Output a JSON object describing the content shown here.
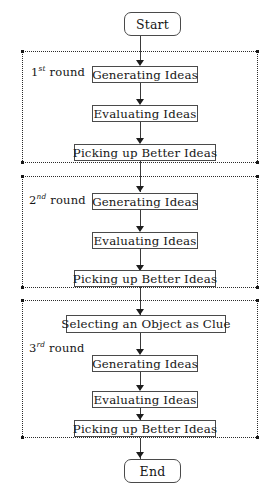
{
  "diagram": {
    "start_label": "Start",
    "end_label": "End",
    "clue_step_label": "Selecting an Object as Clue",
    "rounds": [
      {
        "ordinal": "1",
        "suffix": "st",
        "word": "round",
        "steps": [
          "Generating Ideas",
          "Evaluating Ideas",
          "Picking up Better Ideas"
        ]
      },
      {
        "ordinal": "2",
        "suffix": "nd",
        "word": "round",
        "steps": [
          "Generating Ideas",
          "Evaluating Ideas",
          "Picking up Better Ideas"
        ]
      },
      {
        "ordinal": "3",
        "suffix": "rd",
        "word": "round",
        "steps": [
          "Generating Ideas",
          "Evaluating Ideas",
          "Picking up Better Ideas"
        ]
      }
    ],
    "colors": {
      "stroke": "#4a4a4a",
      "text": "#161616",
      "dotted": "#2b2b2b",
      "background": "#ffffff"
    }
  }
}
